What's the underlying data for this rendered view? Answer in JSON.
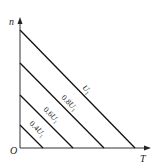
{
  "diagram": {
    "axes": {
      "y_label": "n",
      "x_label": "T",
      "origin_label": "O"
    },
    "lines": [
      {
        "label_text": "U",
        "label_sub": "1",
        "label_prefix": "",
        "x1": 20,
        "y1": 30,
        "x2": 135,
        "y2": 148,
        "label_x": 82,
        "label_y": 88
      },
      {
        "label_text": "U",
        "label_sub": "1",
        "label_prefix": "0.8",
        "x1": 20,
        "y1": 63,
        "x2": 104,
        "y2": 148,
        "label_x": 61,
        "label_y": 98
      },
      {
        "label_text": "U",
        "label_sub": "1",
        "label_prefix": "0.6",
        "x1": 20,
        "y1": 95,
        "x2": 73,
        "y2": 148,
        "label_x": 43,
        "label_y": 110
      },
      {
        "label_text": "U",
        "label_sub": "1",
        "label_prefix": "0.4",
        "x1": 20,
        "y1": 125,
        "x2": 43,
        "y2": 148,
        "label_x": 29,
        "label_y": 124
      }
    ],
    "colors": {
      "line": "#111111",
      "axis": "#333333"
    }
  }
}
